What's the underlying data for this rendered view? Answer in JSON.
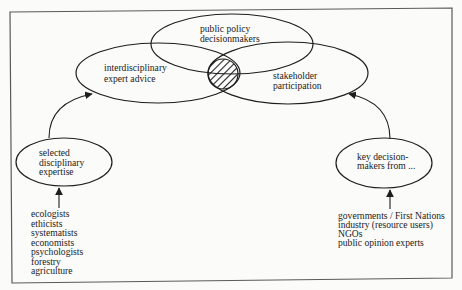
{
  "diagram": {
    "colors": {
      "stroke": "#1e1e1e",
      "frame": "#5a5a5a",
      "text": "#222222",
      "background": "#fbfbfa"
    },
    "core": {
      "top": {
        "lines": [
          "public policy",
          "decisionmakers"
        ]
      },
      "left": {
        "lines": [
          "interdisciplinary",
          "expert advice"
        ]
      },
      "right": {
        "lines": [
          "stakeholder",
          "participation"
        ]
      },
      "intersection": "hatched-overlap"
    },
    "inputs": {
      "left": {
        "node": {
          "lines": [
            "selected",
            "disciplinary",
            "expertise"
          ]
        },
        "sources": [
          "ecologists",
          "ethicists",
          "systematists",
          "economists",
          "psychologists",
          "forestry",
          "agriculture"
        ]
      },
      "right": {
        "node": {
          "lines": [
            "key decision-",
            "makers from ..."
          ]
        },
        "sources": [
          "governments / First Nations",
          "industry (resource users)",
          "NGOs",
          "public opinion experts"
        ]
      }
    }
  }
}
